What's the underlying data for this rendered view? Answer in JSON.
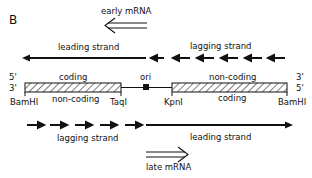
{
  "figure": {
    "panel_label": "B",
    "early_mrna": "early mRNA",
    "late_mrna": "late mRNA",
    "top_leading": "leading strand",
    "top_lagging": "lagging strand",
    "bottom_lagging": "lagging strand",
    "bottom_leading": "leading strand",
    "left_segment": {
      "top_label": "coding",
      "bottom_label": "non-coding",
      "left_site": "BamHI",
      "right_site": "TaqI"
    },
    "right_segment": {
      "top_label": "non-coding",
      "bottom_label": "coding",
      "left_site": "KpnI",
      "right_site": "BamHI"
    },
    "origin_label": "ori",
    "ends": {
      "left_top": "5'",
      "left_bottom": "3'",
      "right_top": "3'",
      "right_bottom": "5'"
    }
  }
}
